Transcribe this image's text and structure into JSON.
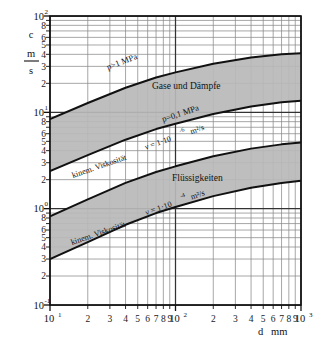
{
  "chart_data": {
    "type": "area",
    "title": "",
    "xlabel": "d",
    "xunit": "mm",
    "ylabel": "c",
    "yunit_numerator": "m",
    "yunit_denominator": "s",
    "xscale": "log",
    "yscale": "log",
    "xlim": [
      10,
      1000
    ],
    "ylim": [
      0.1,
      100
    ],
    "grid": true,
    "legend_position": "inline-annotations",
    "x_tick_labels": [
      "10",
      "2",
      "3",
      "4",
      "5",
      "6",
      "7",
      "8",
      "9",
      "10",
      "2",
      "3",
      "4",
      "5",
      "6",
      "7",
      "8",
      "9",
      "10"
    ],
    "x_major_labels": [
      {
        "mantissa": "10",
        "exponent": "1",
        "value": 10
      },
      {
        "mantissa": "10",
        "exponent": "2",
        "value": 100
      },
      {
        "mantissa": "10",
        "exponent": "3",
        "value": 1000
      }
    ],
    "x_minor_labels": [
      2,
      3,
      4,
      5,
      6,
      7,
      8,
      9
    ],
    "y_major_labels": [
      {
        "mantissa": "10",
        "exponent": "2",
        "value": 100
      },
      {
        "mantissa": "10",
        "exponent": "1",
        "value": 10
      },
      {
        "mantissa": "10",
        "exponent": "0",
        "value": 1
      },
      {
        "mantissa": "10",
        "exponent": "-1",
        "value": 0.1
      }
    ],
    "y_minor_labels": [
      8,
      6,
      5,
      4,
      3,
      2
    ],
    "bands": [
      {
        "name": "Gase und Dämpfe",
        "label": "Gase und Dämpfe",
        "fill": "#b8b8b8",
        "upper_curve_label": "p>1 MPa",
        "lower_curve_label": "p=0,1 MPa",
        "upper_points": [
          {
            "d": 10,
            "c": 8.5
          },
          {
            "d": 20,
            "c": 12.5
          },
          {
            "d": 40,
            "c": 18.0
          },
          {
            "d": 70,
            "c": 23.0
          },
          {
            "d": 100,
            "c": 26.0
          },
          {
            "d": 200,
            "c": 32.0
          },
          {
            "d": 400,
            "c": 37.0
          },
          {
            "d": 700,
            "c": 40.0
          },
          {
            "d": 1000,
            "c": 41.0
          }
        ],
        "lower_points": [
          {
            "d": 10,
            "c": 2.45
          },
          {
            "d": 20,
            "c": 3.6
          },
          {
            "d": 40,
            "c": 5.2
          },
          {
            "d": 70,
            "c": 6.7
          },
          {
            "d": 100,
            "c": 7.6
          },
          {
            "d": 200,
            "c": 9.6
          },
          {
            "d": 400,
            "c": 11.5
          },
          {
            "d": 700,
            "c": 12.7
          },
          {
            "d": 1000,
            "c": 13.2
          }
        ]
      },
      {
        "name": "Flüssigkeiten",
        "label": "Flüssigkeiten",
        "fill": "#b8b8b8",
        "upper_curve_label_prefix": "kinem. Viskosität",
        "upper_curve_label_value": "ν = 1·10",
        "upper_curve_label_exponent": "-6",
        "upper_curve_label_unit": "m²/s",
        "lower_curve_label_prefix": "kinem. Viskosität",
        "lower_curve_label_value": "ν = 1·10",
        "lower_curve_label_exponent": "-4",
        "lower_curve_label_unit": "m²/s",
        "upper_points": [
          {
            "d": 10,
            "c": 0.83
          },
          {
            "d": 20,
            "c": 1.25
          },
          {
            "d": 40,
            "c": 1.85
          },
          {
            "d": 70,
            "c": 2.4
          },
          {
            "d": 100,
            "c": 2.75
          },
          {
            "d": 200,
            "c": 3.5
          },
          {
            "d": 400,
            "c": 4.2
          },
          {
            "d": 700,
            "c": 4.65
          },
          {
            "d": 1000,
            "c": 4.85
          }
        ],
        "lower_points": [
          {
            "d": 10,
            "c": 0.3
          },
          {
            "d": 20,
            "c": 0.45
          },
          {
            "d": 40,
            "c": 0.68
          },
          {
            "d": 70,
            "c": 0.9
          },
          {
            "d": 100,
            "c": 1.04
          },
          {
            "d": 200,
            "c": 1.35
          },
          {
            "d": 400,
            "c": 1.65
          },
          {
            "d": 700,
            "c": 1.85
          },
          {
            "d": 1000,
            "c": 1.95
          }
        ]
      }
    ],
    "annotations": [
      {
        "id": "gas-upper",
        "text": "p>1 MPa"
      },
      {
        "id": "gas-band",
        "text": "Gase und Dämpfe"
      },
      {
        "id": "gas-lower",
        "text": "p=0,1 MPa"
      },
      {
        "id": "liq-upper-a",
        "text": "kinem. Viskosität"
      },
      {
        "id": "liq-upper-b",
        "text": "ν = 1·10"
      },
      {
        "id": "liq-upper-b-exp",
        "text": "-6"
      },
      {
        "id": "liq-upper-b-unit",
        "text": "m²/s"
      },
      {
        "id": "liq-band",
        "text": "Flüssigkeiten"
      },
      {
        "id": "liq-lower-a",
        "text": "kinem. Viskosität"
      },
      {
        "id": "liq-lower-b",
        "text": "ν = 1·10"
      },
      {
        "id": "liq-lower-b-exp",
        "text": "-4"
      },
      {
        "id": "liq-lower-b-unit",
        "text": "m²/s"
      }
    ]
  },
  "axes": {
    "y": {
      "symbol": "c",
      "unit_numerator": "m",
      "unit_denominator": "s",
      "majors": [
        {
          "m": "10",
          "e": "2"
        },
        {
          "m": "10",
          "e": "1"
        },
        {
          "m": "10",
          "e": "0"
        },
        {
          "m": "10",
          "e": "-1"
        }
      ],
      "minors_decade": [
        "8",
        "6",
        "5",
        "4",
        "3",
        "2"
      ]
    },
    "x": {
      "symbol": "d",
      "unit": "mm",
      "majors": [
        {
          "m": "10",
          "e": "1"
        },
        {
          "m": "10",
          "e": "2"
        },
        {
          "m": "10",
          "e": "3"
        }
      ],
      "minors_decade": [
        "2",
        "3",
        "4",
        "5",
        "6",
        "7",
        "8",
        "9"
      ]
    }
  },
  "labels": {
    "gas_upper": "p>1 MPa",
    "gas_band": "Gase und Dämpfe",
    "gas_lower": "p=0,1 MPa",
    "visk_prefix": "kinem. Viskosität",
    "nu_eq": "ν = 1·10",
    "exp_minus6": "-6",
    "exp_minus4": "-4",
    "unit_m2s": "m²/s",
    "liq_band": "Flüssigkeiten"
  },
  "colors": {
    "band_fill": "#b8b8b8",
    "grid": "#808080",
    "curve": "#111111",
    "axis": "#111111",
    "background": "#ffffff"
  }
}
